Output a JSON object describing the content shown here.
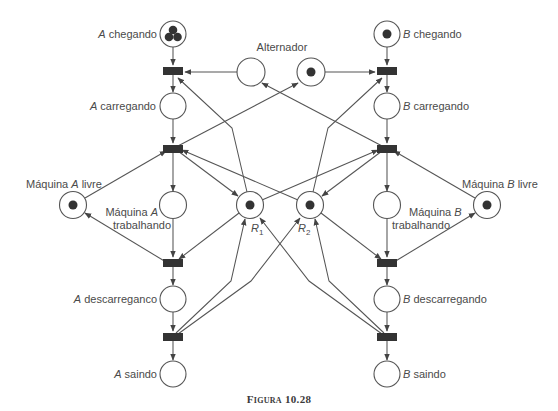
{
  "figure": {
    "caption_prefix": "Figura",
    "caption_number": "10.28",
    "type": "petri-net"
  },
  "places": {
    "a_chegando": {
      "italic": "A",
      "text": " chegando",
      "tokens": 3
    },
    "a_carregando": {
      "italic": "A",
      "text": " carregando",
      "tokens": 0
    },
    "maquina_a_livre": {
      "pre": "Máquina ",
      "italic": "A",
      "post": " livre",
      "tokens": 1
    },
    "maquina_a_trabalhando": {
      "line1_pre": "Máquina ",
      "line1_italic": "A",
      "line2": "trabalhando",
      "tokens": 0
    },
    "a_descarregando": {
      "italic": "A",
      "text": " descarreganco",
      "tokens": 0
    },
    "a_saindo": {
      "italic": "A",
      "text": " saindo",
      "tokens": 0
    },
    "alternador": {
      "text": "Alternador"
    },
    "alternador_left": {
      "tokens": 0
    },
    "alternador_right": {
      "tokens": 1
    },
    "r1": {
      "italic": "R",
      "sub": "1",
      "tokens": 1
    },
    "r2": {
      "italic": "R",
      "sub": "2",
      "tokens": 1
    },
    "b_chegando": {
      "italic": "B",
      "text": " chegando",
      "tokens": 1
    },
    "b_carregando": {
      "italic": "B",
      "text": " carregando",
      "tokens": 0
    },
    "maquina_b_livre": {
      "pre": "Máquina ",
      "italic": "B",
      "post": " livre",
      "tokens": 1
    },
    "maquina_b_trabalhando": {
      "line1_pre": "Máquina ",
      "line1_italic": "B",
      "line2": "trabalhando",
      "tokens": 0
    },
    "b_descarregando": {
      "italic": "B",
      "text": " descarregando",
      "tokens": 0
    },
    "b_saindo": {
      "italic": "B",
      "text": " saindo",
      "tokens": 0
    }
  },
  "transitions": [
    "tA1",
    "tA2",
    "tA3",
    "tA4",
    "tB1",
    "tB2",
    "tB3",
    "tB4"
  ],
  "colors": {
    "stroke": "#555555",
    "fill_dark": "#333333",
    "text": "#4a4a4a",
    "background": "#ffffff"
  }
}
